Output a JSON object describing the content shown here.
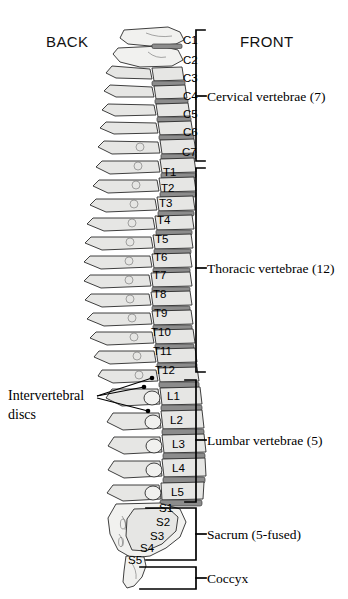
{
  "figure": {
    "background_color": "#ffffff",
    "ink_color": "#000000",
    "bone_fill": "#e6e6e4",
    "disc_fill": "#8c8c8c"
  },
  "orientation": {
    "back_label": "BACK",
    "front_label": "FRONT"
  },
  "callouts": [
    {
      "id": "intervertebral-discs",
      "line1": "Intervertebral",
      "line2": "discs"
    }
  ],
  "regions": [
    {
      "id": "cervical",
      "label": "Cervical vertebrae (7)",
      "count": 7,
      "levels": [
        "C1",
        "C2",
        "C3",
        "C4",
        "C5",
        "C6",
        "C7"
      ]
    },
    {
      "id": "thoracic",
      "label": "Thoracic vertebrae (12)",
      "count": 12,
      "levels": [
        "T1",
        "T2",
        "T3",
        "T4",
        "T5",
        "T6",
        "T7",
        "T8",
        "T9",
        "T10",
        "T11",
        "T12"
      ]
    },
    {
      "id": "lumbar",
      "label": "Lumbar vertebrae (5)",
      "count": 5,
      "levels": [
        "L1",
        "L2",
        "L3",
        "L4",
        "L5"
      ]
    },
    {
      "id": "sacrum",
      "label": "Sacrum (5-fused)",
      "count": 5,
      "levels": [
        "S1",
        "S2",
        "S3",
        "S4",
        "S5"
      ]
    },
    {
      "id": "coccyx",
      "label": "Coccyx",
      "count": 1,
      "levels": []
    }
  ],
  "level_labels": {
    "C1": "C1",
    "C2": "C2",
    "C3": "C3",
    "C4": "C4",
    "C5": "C5",
    "C6": "C6",
    "C7": "C7",
    "T1": "T1",
    "T2": "T2",
    "T3": "T3",
    "T4": "T4",
    "T5": "T5",
    "T6": "T6",
    "T7": "T7",
    "T8": "T8",
    "T9": "T9",
    "T10": "T10",
    "T11": "T11",
    "T12": "T12",
    "L1": "L1",
    "L2": "L2",
    "L3": "L3",
    "L4": "L4",
    "L5": "L5",
    "S1": "S1",
    "S2": "S2",
    "S3": "S3",
    "S4": "S4",
    "S5": "S5"
  },
  "group_labels": {
    "cervical": "Cervical vertebrae (7)",
    "thoracic": "Thoracic vertebrae (12)",
    "lumbar": "Lumbar vertebrae (5)",
    "sacrum": "Sacrum (5-fused)",
    "coccyx": "Coccyx"
  }
}
